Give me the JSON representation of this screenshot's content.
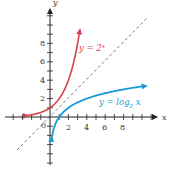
{
  "chart_data": {
    "type": "line",
    "title": "",
    "xlabel": "x",
    "ylabel": "y",
    "xlim": [
      -4.8,
      11.6
    ],
    "ylim": [
      -5.2,
      11.8
    ],
    "grid": false,
    "x_ticks": [
      2,
      4,
      6,
      8
    ],
    "y_ticks": [
      2,
      4,
      6,
      8
    ],
    "origin_label": "0",
    "series": [
      {
        "name": "y = 2^x",
        "label_main": "y = 2",
        "label_sup": "x",
        "color": "#d9404a",
        "x": [
          -2.4,
          -2,
          -1,
          0,
          1,
          2,
          3,
          3.25
        ],
        "y": [
          0.19,
          0.25,
          0.5,
          1,
          2,
          4,
          8,
          9.5
        ]
      },
      {
        "name": "y = log_2 x",
        "label_main": "y = log",
        "label_sub": "2",
        "label_tail": " x",
        "color": "#1a9ad6",
        "x": [
          0.22,
          0.5,
          1,
          2,
          4,
          6,
          8,
          10,
          10.5
        ],
        "y": [
          -2.2,
          -1,
          0,
          1,
          2,
          2.58,
          3,
          3.32,
          3.39
        ]
      },
      {
        "name": "y = x",
        "style": "dashed",
        "color": "#555555",
        "x": [
          -3.5,
          10.6
        ],
        "y": [
          -3.5,
          10.6
        ]
      }
    ]
  },
  "axes": {
    "x_label": "x",
    "y_label": "y",
    "origin": "0",
    "x_tick_labels": [
      "2",
      "4",
      "6",
      "8"
    ],
    "y_tick_labels": [
      "2",
      "4",
      "6",
      "8"
    ]
  },
  "labels": {
    "exp_main": "y = 2",
    "exp_sup": "x",
    "log_main": "y = log",
    "log_sub": "2",
    "log_tail": " x"
  }
}
